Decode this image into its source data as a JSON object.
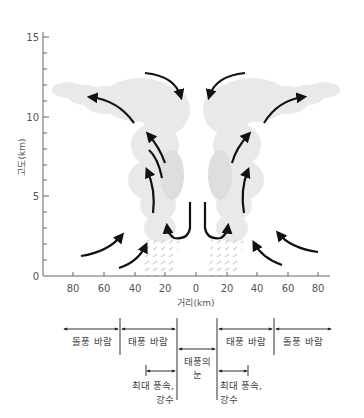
{
  "diagram": {
    "y_axis": {
      "label": "고도(km)",
      "ticks": [
        {
          "value": "0",
          "y": 276
        },
        {
          "value": "5",
          "y": 196
        },
        {
          "value": "10",
          "y": 117
        },
        {
          "value": "15",
          "y": 37
        }
      ]
    },
    "x_axis": {
      "label": "거리(km)",
      "ticks": [
        {
          "value": "80",
          "x": 73
        },
        {
          "value": "60",
          "x": 104
        },
        {
          "value": "40",
          "x": 135
        },
        {
          "value": "20",
          "x": 165
        },
        {
          "value": "0",
          "x": 196
        },
        {
          "value": "20",
          "x": 227
        },
        {
          "value": "40",
          "x": 257
        },
        {
          "value": "60",
          "x": 288
        },
        {
          "value": "80",
          "x": 318
        }
      ]
    },
    "legend": {
      "left_gust": "돌풍 바람",
      "left_typhoon": "태풍 바람",
      "eye_line1": "태풍의",
      "eye_line2": "눈",
      "right_typhoon": "태풍 바람",
      "right_gust": "돌풍 바람",
      "left_max_line1": "최대 풍속,",
      "left_max_line2": "강수",
      "right_max_line1": "최대 풍속,",
      "right_max_line2": "강수"
    },
    "colors": {
      "cloud": "#e9e9e9",
      "cloud_shade": "#dcdcdc",
      "arrow": "#111111",
      "axis": "#666666",
      "rain": "#cfcfcf"
    }
  }
}
